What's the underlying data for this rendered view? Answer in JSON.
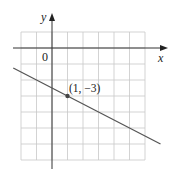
{
  "chart_data": {
    "type": "line",
    "title": "",
    "xlabel": "x",
    "ylabel": "y",
    "origin_label": "0",
    "xlim": [
      -2,
      6
    ],
    "ylim": [
      -7,
      1
    ],
    "grid": true,
    "grid_step": 1,
    "series": [
      {
        "name": "line",
        "slope": -0.5,
        "intercept": -2.5,
        "x_range": [
          -2.5,
          7
        ],
        "color": "#555555"
      }
    ],
    "points": [
      {
        "x": 1,
        "y": -3,
        "label": "(1, −3)"
      }
    ]
  }
}
